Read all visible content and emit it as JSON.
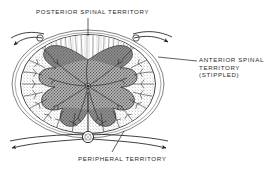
{
  "figure": {
    "type": "anatomical-diagram",
    "background_color": "#ffffff",
    "ink_color": "#2b2b2b"
  },
  "labels": {
    "posterior": {
      "name": "posterior-spinal-territory-label",
      "text": "POSTERIOR SPINAL TERRITORY",
      "lines": [
        "POSTERIOR SPINAL TERRITORY"
      ]
    },
    "anterior": {
      "name": "anterior-spinal-territory-label",
      "text": "ANTERIOR SPINAL TERRITORY (STIPPLED)",
      "lines": [
        "ANTERIOR SPINAL",
        "TERRITORY",
        "(STIPPLED)"
      ]
    },
    "peripheral": {
      "name": "peripheral-territory-label",
      "text": "PERIPHERAL TERRITORY",
      "lines": [
        "PERIPHERAL TERRITORY"
      ]
    }
  },
  "leader_lines": [
    {
      "name": "leader-posterior",
      "from": [
        88,
        18
      ],
      "to": [
        88,
        36
      ]
    },
    {
      "name": "leader-anterior",
      "from": [
        197,
        61
      ],
      "to": [
        160,
        58
      ]
    },
    {
      "name": "leader-peripheral",
      "from": [
        112,
        152
      ],
      "to": [
        123,
        132
      ]
    }
  ],
  "structures": [
    {
      "name": "cord-outline",
      "description": "oval spinal cord cross-section outline"
    },
    {
      "name": "pial-vessel-ring",
      "description": "circumferential pial arterial ring surrounding cord"
    },
    {
      "name": "anterior-spinal-artery",
      "description": "anterior spinal artery at ventral midline"
    },
    {
      "name": "sulcal-artery",
      "description": "central sulcal artery ascending into cord"
    },
    {
      "name": "gray-matter-butterfly",
      "description": "butterfly shaped central gray matter, dark hatched"
    },
    {
      "name": "anterior-territory-stipple",
      "description": "stippled anterior spinal artery territory"
    },
    {
      "name": "posterior-territory-striations",
      "description": "unstippled posterior columns with vertical striations"
    },
    {
      "name": "penetrating-arteries",
      "description": "radial penetrating branches from pial ring"
    },
    {
      "name": "feeder-vessel-arrows",
      "description": "arrows showing direction of arterial inflow"
    }
  ]
}
